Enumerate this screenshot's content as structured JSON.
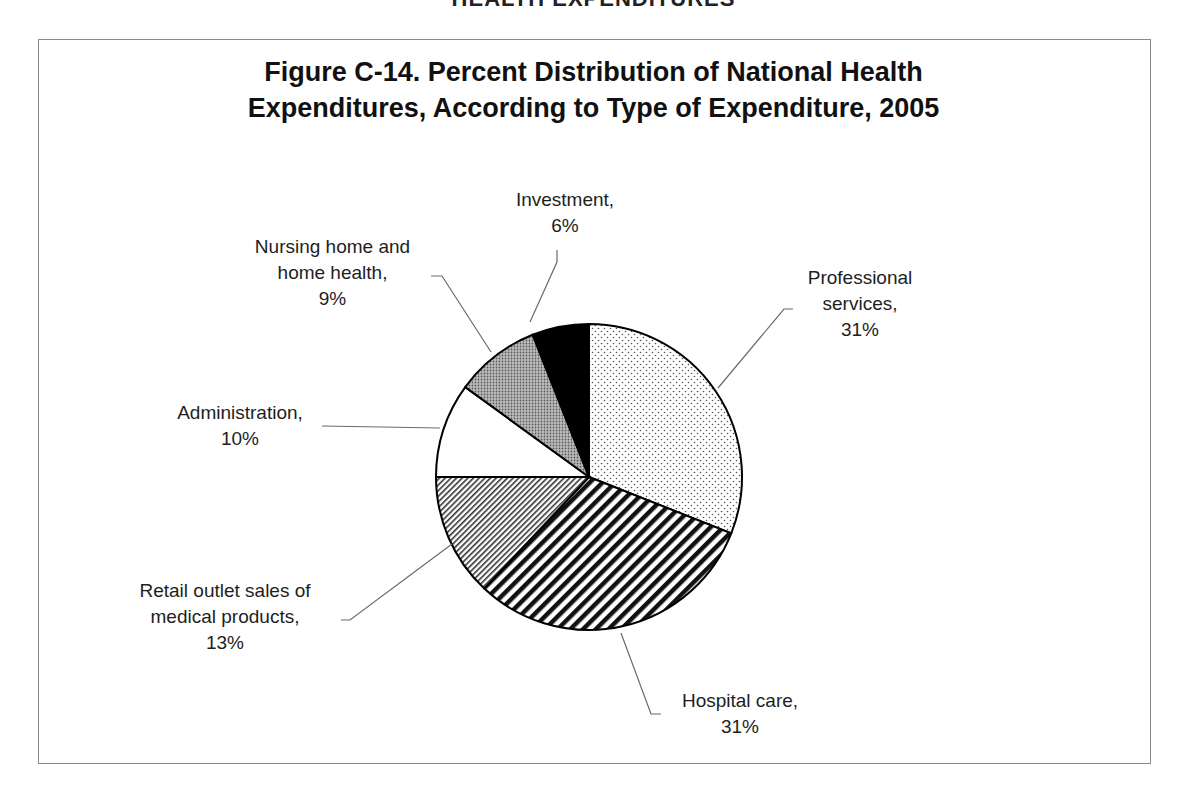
{
  "page_header": "HEALTH EXPENDITURES",
  "chart_data": {
    "type": "pie",
    "title": "Figure C-14. Percent Distribution of National Health Expenditures, According to Type of Expenditure, 2005",
    "title_lines": [
      "Figure C-14. Percent Distribution of National Health",
      "Expenditures, According to Type of Expenditure, 2005"
    ],
    "start_angle": "12 o'clock, clockwise",
    "categories": [
      "Professional services",
      "Hospital care",
      "Retail outlet sales of medical products",
      "Administration",
      "Nursing home and home health",
      "Investment"
    ],
    "values": [
      31,
      31,
      13,
      10,
      9,
      6
    ],
    "unit": "%",
    "legend": "none (data labels with leader lines)",
    "slices": [
      {
        "name": "Professional services",
        "value": 31,
        "pattern": "dots",
        "label_lines": [
          "Professional",
          "services,",
          "31%"
        ]
      },
      {
        "name": "Hospital care",
        "value": 31,
        "pattern": "wide-diagonal-stripes",
        "label_lines": [
          "Hospital care,",
          "31%"
        ]
      },
      {
        "name": "Retail outlet sales of medical products",
        "value": 13,
        "pattern": "fine-diagonal-stripes",
        "label_lines": [
          "Retail outlet sales of",
          "medical products,",
          "13%"
        ]
      },
      {
        "name": "Administration",
        "value": 10,
        "pattern": "white",
        "label_lines": [
          "Administration,",
          "10%"
        ]
      },
      {
        "name": "Nursing home and home health",
        "value": 9,
        "pattern": "dense-gray-dots",
        "label_lines": [
          "Nursing home and",
          "home health,",
          "9%"
        ]
      },
      {
        "name": "Investment",
        "value": 6,
        "pattern": "solid-black",
        "label_lines": [
          "Investment,",
          "6%"
        ]
      }
    ]
  }
}
